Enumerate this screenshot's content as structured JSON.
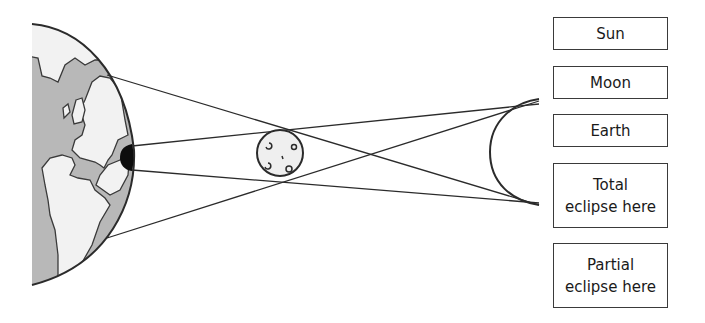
{
  "diagram": {
    "colors": {
      "outline": "#2b2b2b",
      "land": "#f2f2f2",
      "ocean": "#b8b8b8",
      "shadow": "#0d0d0d",
      "moon_fill": "#efefef"
    },
    "objects": [
      {
        "name": "earth-like body (left)",
        "shape": "half-globe with continents"
      },
      {
        "name": "small moon-like body (center)",
        "shape": "circle with craters"
      },
      {
        "name": "crescent body (right)",
        "shape": "arc"
      }
    ]
  },
  "labels": [
    {
      "id": "sun",
      "lines": [
        "Sun"
      ]
    },
    {
      "id": "moon",
      "lines": [
        "Moon"
      ]
    },
    {
      "id": "earth",
      "lines": [
        "Earth"
      ]
    },
    {
      "id": "total",
      "lines": [
        "Total",
        "eclipse here"
      ]
    },
    {
      "id": "partial",
      "lines": [
        "Partial",
        "eclipse here"
      ]
    }
  ]
}
